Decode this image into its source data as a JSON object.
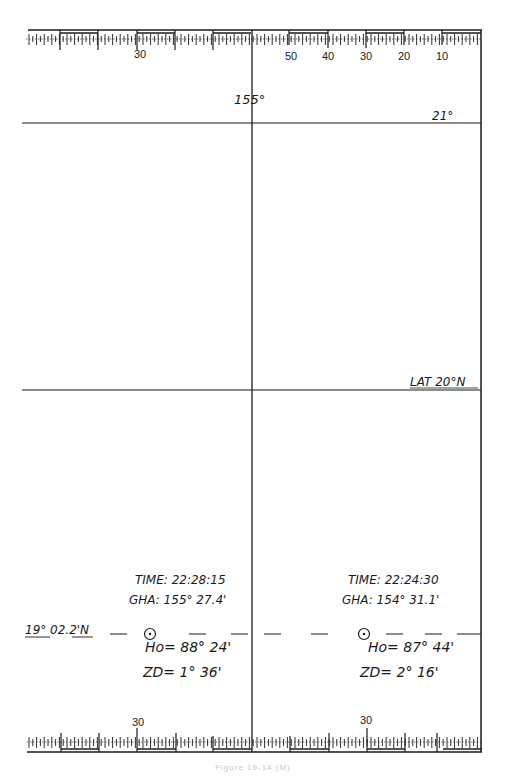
{
  "sheet": {
    "title": "Plotting sheet - meridian transit / high-altitude sun sight",
    "caption": "Figure 19-14 (M)"
  },
  "top_scale": {
    "labels": [
      {
        "text": "30",
        "x": 140
      },
      {
        "text": "50",
        "x": 290
      },
      {
        "text": "40",
        "x": 327
      },
      {
        "text": "30",
        "x": 365
      },
      {
        "text": "20",
        "x": 403
      },
      {
        "text": "10",
        "x": 441
      }
    ]
  },
  "bottom_scale": {
    "labels": [
      {
        "text": "30",
        "x": 138
      },
      {
        "text": "30",
        "x": 366
      }
    ]
  },
  "grid": {
    "meridian_label": "155°",
    "parallel_top_label": "21°",
    "parallel_mid_label": "LAT 20°N"
  },
  "position": {
    "latitude_label": "19° 02.2'N"
  },
  "sight_left": {
    "time": "TIME: 22:28:15",
    "gha": "GHA: 155° 27.4'",
    "ho": "Ho= 88° 24'",
    "zd": "ZD= 1° 36'",
    "symbol": "sun-symbol"
  },
  "sight_right": {
    "time": "TIME: 22:24:30",
    "gha": "GHA: 154° 31.1'",
    "ho": "Ho= 87° 44'",
    "zd": "ZD= 2° 16'",
    "symbol": "sun-symbol"
  },
  "colors": {
    "ink": "#1a1a1a",
    "paper": "#ffffff"
  }
}
